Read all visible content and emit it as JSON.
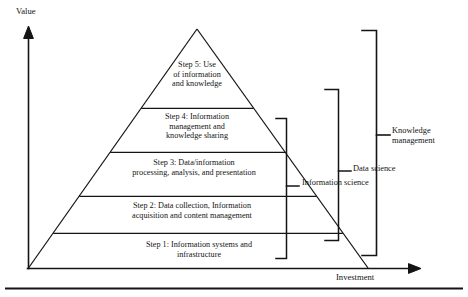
{
  "figure": {
    "name": "value-investment-knowledge-pyramid",
    "axes": {
      "y_label": "Value",
      "x_label": "Investment"
    },
    "pyramid": {
      "tiers": [
        {
          "id": "step5",
          "label": "Step 5: Use\nof information\nand knowledge"
        },
        {
          "id": "step4",
          "label": "Step 4: Information\nmanagement and\nknowledge sharing"
        },
        {
          "id": "step3",
          "label": "Step 3: Data/information\nprocessing, analysis, and presentation"
        },
        {
          "id": "step2",
          "label": "Step 2: Data collection, Information\nacquisition and content management"
        },
        {
          "id": "step1",
          "label": "Step 1: Information systems and\ninfrastructure"
        }
      ]
    },
    "brackets": [
      {
        "id": "information-science",
        "label": "Information science"
      },
      {
        "id": "data-science",
        "label": "Data science"
      },
      {
        "id": "knowledge-management",
        "label": "Knowledge\nmanagement"
      }
    ],
    "colors": {
      "stroke": "#141414",
      "background": "#ffffff"
    }
  }
}
